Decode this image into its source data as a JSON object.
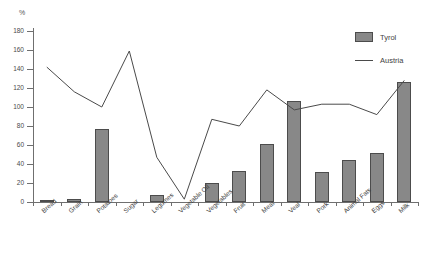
{
  "chart_data": {
    "type": "bar",
    "title": "",
    "subtitle": "",
    "xlabel": "",
    "ylabel": "%",
    "ylim": [
      0,
      180
    ],
    "ytick_step": 20,
    "yticks": [
      0,
      20,
      40,
      60,
      80,
      100,
      120,
      140,
      160,
      180
    ],
    "grid": false,
    "legend_position": "top-right",
    "categories": [
      "Bread",
      "Grain",
      "Potatoes",
      "Sugar",
      "Legumes",
      "Vegetable Oil",
      "Vegetables",
      "Fruit",
      "Meat",
      "Veal",
      "Pork",
      "Animal Fats",
      "Eggs",
      "Milk"
    ],
    "series": [
      {
        "name": "Tyrol",
        "type": "bar",
        "color": "#888888",
        "values": [
          2,
          3,
          77,
          0,
          7,
          0,
          20,
          33,
          61,
          106,
          32,
          44,
          52,
          126
        ]
      },
      {
        "name": "Austria",
        "type": "line",
        "color": "#4a4a4a",
        "values": [
          142,
          116,
          100,
          159,
          47,
          3,
          87,
          80,
          118,
          97,
          103,
          103,
          92,
          128
        ]
      }
    ]
  },
  "legend": {
    "items": [
      {
        "label": "Tyrol",
        "marker": "bar-swatch"
      },
      {
        "label": "Austria",
        "marker": "line-swatch"
      }
    ]
  },
  "axis": {
    "y_unit_label": "%"
  }
}
